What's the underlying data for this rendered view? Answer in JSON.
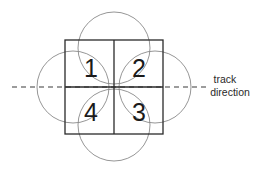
{
  "diagram": {
    "title": "",
    "square": {
      "x": 65,
      "y": 40,
      "width": 98,
      "height": 94,
      "center_x": 114,
      "center_y": 87
    },
    "circles": [
      {
        "name": "top",
        "cx": 114,
        "cy": 48,
        "r": 36
      },
      {
        "name": "bottom",
        "cx": 114,
        "cy": 125,
        "r": 36
      },
      {
        "name": "left",
        "cx": 73,
        "cy": 87,
        "r": 36
      },
      {
        "name": "right",
        "cx": 155,
        "cy": 87,
        "r": 36
      }
    ],
    "quadrants": [
      {
        "id": "1",
        "label": "1",
        "x": 91,
        "y": 77
      },
      {
        "id": "2",
        "label": "2",
        "x": 139,
        "y": 77
      },
      {
        "id": "3",
        "label": "3",
        "x": 139,
        "y": 121
      },
      {
        "id": "4",
        "label": "4",
        "x": 91,
        "y": 121
      }
    ],
    "track": {
      "line": {
        "x1": 12,
        "y1": 87,
        "x2": 246,
        "y2": 87
      },
      "label_line1": "track",
      "label_line2": "direction"
    },
    "colors": {
      "background": "#ffffff",
      "lines": "#2a2a2a",
      "circles": "#8a8a8a",
      "text": "#1a1a1a"
    }
  }
}
